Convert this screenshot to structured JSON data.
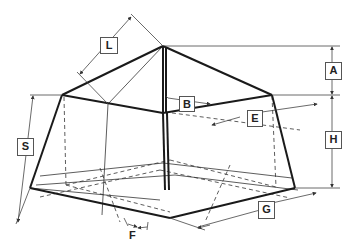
{
  "figure": {
    "labels": {
      "L": "L",
      "A": "A",
      "B": "B",
      "E": "E",
      "S": "S",
      "H": "H",
      "F": "F",
      "G": "G"
    },
    "colors": {
      "outline": "#1a1a1a",
      "dimension": "#444444",
      "background": "#ffffff"
    }
  }
}
